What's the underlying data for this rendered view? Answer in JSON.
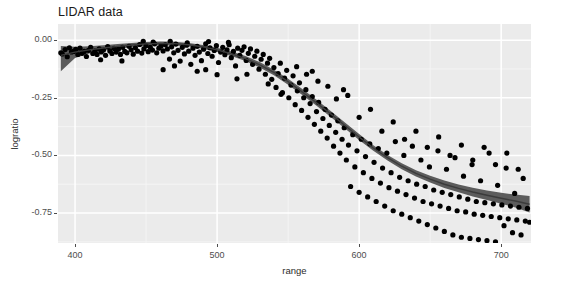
{
  "chart_data": {
    "type": "scatter",
    "title": "LIDAR data",
    "xlabel": "range",
    "ylabel": "logratio",
    "xlim": [
      388,
      721
    ],
    "ylim": [
      -0.88,
      0.07
    ],
    "xticks": [
      400,
      500,
      600,
      700
    ],
    "xtick_labels": [
      "400",
      "500",
      "600",
      "700"
    ],
    "yticks": [
      0.0,
      -0.25,
      -0.5,
      -0.75
    ],
    "ytick_labels": [
      "0.00",
      "-0.25",
      "-0.50",
      "-0.75"
    ],
    "grid": true,
    "grid_major_color": "#ffffff",
    "grid_minor_color": "#f5f5f5",
    "panel_background": "#ebebeb",
    "legend_position": "none",
    "point_color": "#000000",
    "point_radius": 2.6,
    "fit_line_color": "#3b3b3b",
    "fit_band_color": "#4f4f4f",
    "fit_description": "LOESS smooth of logratio on range with shaded confidence band",
    "points": [
      [
        390.0,
        -0.055
      ],
      [
        391.0,
        -0.06
      ],
      [
        393.0,
        -0.041
      ],
      [
        394.5,
        -0.072
      ],
      [
        396.0,
        -0.033
      ],
      [
        397.5,
        -0.051
      ],
      [
        399.0,
        -0.049
      ],
      [
        400.5,
        -0.04
      ],
      [
        402.0,
        -0.062
      ],
      [
        403.5,
        -0.035
      ],
      [
        405.0,
        -0.057
      ],
      [
        406.5,
        -0.049
      ],
      [
        408.0,
        -0.071
      ],
      [
        409.5,
        -0.044
      ],
      [
        411.0,
        -0.031
      ],
      [
        412.5,
        -0.058
      ],
      [
        414.0,
        -0.046
      ],
      [
        415.5,
        -0.062
      ],
      [
        417.0,
        -0.038
      ],
      [
        418.5,
        -0.051
      ],
      [
        420.0,
        -0.043
      ],
      [
        421.5,
        -0.066
      ],
      [
        423.0,
        -0.028
      ],
      [
        424.5,
        -0.047
      ],
      [
        426.0,
        -0.058
      ],
      [
        427.5,
        -0.036
      ],
      [
        429.0,
        -0.052
      ],
      [
        430.5,
        -0.039
      ],
      [
        432.0,
        -0.062
      ],
      [
        433.5,
        -0.031
      ],
      [
        435.0,
        -0.049
      ],
      [
        436.5,
        -0.055
      ],
      [
        438.0,
        -0.027
      ],
      [
        439.5,
        -0.042
      ],
      [
        441.0,
        -0.061
      ],
      [
        442.5,
        -0.033
      ],
      [
        444.0,
        -0.048
      ],
      [
        445.5,
        -0.019
      ],
      [
        447.0,
        -0.056
      ],
      [
        448.5,
        -0.038
      ],
      [
        450.0,
        -0.024
      ],
      [
        451.5,
        -0.05
      ],
      [
        453.0,
        -0.031
      ],
      [
        454.5,
        -0.043
      ],
      [
        456.0,
        -0.016
      ],
      [
        457.5,
        -0.055
      ],
      [
        459.0,
        -0.035
      ],
      [
        460.5,
        -0.026
      ],
      [
        462.0,
        -0.047
      ],
      [
        463.5,
        -0.02
      ],
      [
        465.0,
        -0.038
      ],
      [
        466.5,
        -0.082
      ],
      [
        468.0,
        -0.029
      ],
      [
        469.5,
        -0.055
      ],
      [
        471.0,
        -0.017
      ],
      [
        472.5,
        -0.044
      ],
      [
        474.0,
        -0.091
      ],
      [
        475.5,
        -0.031
      ],
      [
        477.0,
        -0.06
      ],
      [
        478.5,
        -0.022
      ],
      [
        480.0,
        -0.048
      ],
      [
        481.5,
        -0.105
      ],
      [
        483.0,
        -0.035
      ],
      [
        484.5,
        -0.066
      ],
      [
        486.0,
        -0.027
      ],
      [
        487.5,
        -0.052
      ],
      [
        489.0,
        -0.089
      ],
      [
        490.5,
        -0.039
      ],
      [
        492.0,
        -0.016
      ],
      [
        493.5,
        -0.058
      ],
      [
        495.0,
        -0.033
      ],
      [
        496.5,
        -0.07
      ],
      [
        498.0,
        -0.045
      ],
      [
        499.5,
        -0.024
      ],
      [
        501.0,
        -0.097
      ],
      [
        502.5,
        -0.052
      ],
      [
        504.0,
        -0.031
      ],
      [
        505.5,
        -0.063
      ],
      [
        507.0,
        -0.042
      ],
      [
        508.5,
        -0.02
      ],
      [
        510.0,
        -0.076
      ],
      [
        511.5,
        -0.049
      ],
      [
        513.0,
        -0.112
      ],
      [
        514.5,
        -0.035
      ],
      [
        516.0,
        -0.066
      ],
      [
        517.5,
        -0.044
      ],
      [
        519.0,
        -0.029
      ],
      [
        520.5,
        -0.088
      ],
      [
        522.0,
        -0.057
      ],
      [
        523.5,
        -0.038
      ],
      [
        525.0,
        -0.105
      ],
      [
        526.5,
        -0.07
      ],
      [
        528.0,
        -0.048
      ],
      [
        529.5,
        -0.126
      ],
      [
        531.0,
        -0.083
      ],
      [
        532.5,
        -0.062
      ],
      [
        534.0,
        -0.148
      ],
      [
        535.5,
        -0.1
      ],
      [
        537.0,
        -0.079
      ],
      [
        538.5,
        -0.17
      ],
      [
        540.0,
        -0.119
      ],
      [
        541.5,
        -0.205
      ],
      [
        543.0,
        -0.145
      ],
      [
        544.5,
        -0.1
      ],
      [
        546.0,
        -0.228
      ],
      [
        547.5,
        -0.165
      ],
      [
        549.0,
        -0.131
      ],
      [
        550.5,
        -0.25
      ],
      [
        552.0,
        -0.195
      ],
      [
        553.5,
        -0.155
      ],
      [
        555.0,
        -0.28
      ],
      [
        556.5,
        -0.22
      ],
      [
        558.0,
        -0.185
      ],
      [
        559.5,
        -0.305
      ],
      [
        561.0,
        -0.25
      ],
      [
        562.5,
        -0.215
      ],
      [
        564.0,
        -0.335
      ],
      [
        565.5,
        -0.275
      ],
      [
        567.0,
        -0.245
      ],
      [
        568.5,
        -0.365
      ],
      [
        570.0,
        -0.31
      ],
      [
        571.5,
        -0.27
      ],
      [
        573.0,
        -0.395
      ],
      [
        574.5,
        -0.34
      ],
      [
        576.0,
        -0.3
      ],
      [
        577.5,
        -0.425
      ],
      [
        579.0,
        -0.37
      ],
      [
        580.5,
        -0.325
      ],
      [
        582.0,
        -0.46
      ],
      [
        583.5,
        -0.4
      ],
      [
        585.0,
        -0.35
      ],
      [
        586.5,
        -0.49
      ],
      [
        588.0,
        -0.43
      ],
      [
        589.5,
        -0.38
      ],
      [
        591.0,
        -0.52
      ],
      [
        592.5,
        -0.455
      ],
      [
        594.0,
        -0.635
      ],
      [
        595.5,
        -0.41
      ],
      [
        597.0,
        -0.55
      ],
      [
        598.5,
        -0.48
      ],
      [
        600.0,
        -0.66
      ],
      [
        601.5,
        -0.43
      ],
      [
        603.0,
        -0.575
      ],
      [
        604.5,
        -0.505
      ],
      [
        606.0,
        -0.68
      ],
      [
        607.5,
        -0.45
      ],
      [
        609.0,
        -0.6
      ],
      [
        610.5,
        -0.53
      ],
      [
        612.0,
        -0.7
      ],
      [
        613.5,
        -0.47
      ],
      [
        615.0,
        -0.62
      ],
      [
        616.5,
        -0.555
      ],
      [
        618.0,
        -0.72
      ],
      [
        619.5,
        -0.49
      ],
      [
        621.0,
        -0.64
      ],
      [
        622.5,
        -0.575
      ],
      [
        624.0,
        -0.74
      ],
      [
        625.5,
        -0.44
      ],
      [
        627.0,
        -0.655
      ],
      [
        628.5,
        -0.595
      ],
      [
        630.0,
        -0.755
      ],
      [
        631.5,
        -0.5
      ],
      [
        633.0,
        -0.67
      ],
      [
        634.5,
        -0.61
      ],
      [
        636.0,
        -0.77
      ],
      [
        637.5,
        -0.46
      ],
      [
        639.0,
        -0.685
      ],
      [
        640.5,
        -0.625
      ],
      [
        642.0,
        -0.785
      ],
      [
        643.5,
        -0.52
      ],
      [
        645.0,
        -0.7
      ],
      [
        646.5,
        -0.635
      ],
      [
        648.0,
        -0.8
      ],
      [
        649.5,
        -0.55
      ],
      [
        651.0,
        -0.71
      ],
      [
        652.5,
        -0.65
      ],
      [
        654.0,
        -0.815
      ],
      [
        655.5,
        -0.48
      ],
      [
        657.0,
        -0.72
      ],
      [
        658.5,
        -0.66
      ],
      [
        660.0,
        -0.83
      ],
      [
        661.5,
        -0.56
      ],
      [
        663.0,
        -0.73
      ],
      [
        664.5,
        -0.67
      ],
      [
        666.0,
        -0.845
      ],
      [
        667.5,
        -0.51
      ],
      [
        669.0,
        -0.74
      ],
      [
        670.5,
        -0.68
      ],
      [
        672.0,
        -0.855
      ],
      [
        673.5,
        -0.59
      ],
      [
        675.0,
        -0.745
      ],
      [
        676.5,
        -0.69
      ],
      [
        678.0,
        -0.86
      ],
      [
        679.5,
        -0.54
      ],
      [
        681.0,
        -0.755
      ],
      [
        682.5,
        -0.7
      ],
      [
        684.0,
        -0.865
      ],
      [
        685.5,
        -0.61
      ],
      [
        687.0,
        -0.76
      ],
      [
        688.5,
        -0.705
      ],
      [
        690.0,
        -0.87
      ],
      [
        691.5,
        -0.49
      ],
      [
        693.0,
        -0.765
      ],
      [
        694.5,
        -0.71
      ],
      [
        696.0,
        -0.875
      ],
      [
        697.5,
        -0.63
      ],
      [
        699.0,
        -0.77
      ],
      [
        700.5,
        -0.715
      ],
      [
        702.0,
        -0.805
      ],
      [
        703.5,
        -0.555
      ],
      [
        705.0,
        -0.775
      ],
      [
        706.5,
        -0.72
      ],
      [
        708.0,
        -0.835
      ],
      [
        709.5,
        -0.665
      ],
      [
        711.0,
        -0.78
      ],
      [
        712.5,
        -0.725
      ],
      [
        714.0,
        -0.845
      ],
      [
        715.5,
        -0.6
      ],
      [
        717.0,
        -0.785
      ],
      [
        718.5,
        -0.73
      ],
      [
        720.0,
        -0.79
      ],
      [
        462.0,
        -0.128
      ],
      [
        470.0,
        -0.112
      ],
      [
        486.0,
        -0.135
      ],
      [
        492.0,
        -0.128
      ],
      [
        500.0,
        -0.15
      ],
      [
        514.0,
        -0.168
      ],
      [
        521.0,
        -0.148
      ],
      [
        536.0,
        -0.19
      ],
      [
        545.0,
        -0.235
      ],
      [
        563.0,
        -0.148
      ],
      [
        571.0,
        -0.178
      ],
      [
        584.0,
        -0.255
      ],
      [
        592.0,
        -0.24
      ],
      [
        600.0,
        -0.335
      ],
      [
        608.0,
        -0.3
      ],
      [
        616.0,
        -0.395
      ],
      [
        624.0,
        -0.355
      ],
      [
        632.0,
        -0.43
      ],
      [
        640.0,
        -0.395
      ],
      [
        648.0,
        -0.465
      ],
      [
        656.0,
        -0.42
      ],
      [
        664.0,
        -0.5
      ],
      [
        672.0,
        -0.455
      ],
      [
        680.0,
        -0.52
      ],
      [
        688.0,
        -0.465
      ],
      [
        696.0,
        -0.54
      ],
      [
        704.0,
        -0.49
      ],
      [
        712.0,
        -0.56
      ],
      [
        418.0,
        -0.085
      ],
      [
        433.0,
        -0.09
      ],
      [
        448.0,
        -0.005
      ],
      [
        455.0,
        -0.008
      ],
      [
        467.0,
        -0.005
      ],
      [
        479.0,
        -0.012
      ],
      [
        494.0,
        -0.006
      ],
      [
        508.0,
        -0.01
      ],
      [
        556.0,
        -0.115
      ],
      [
        567.0,
        -0.135
      ],
      [
        578.0,
        -0.2
      ],
      [
        589.0,
        -0.215
      ]
    ],
    "fit_line": [
      [
        390,
        -0.066
      ],
      [
        400,
        -0.052
      ],
      [
        410,
        -0.042
      ],
      [
        420,
        -0.034
      ],
      [
        430,
        -0.027
      ],
      [
        440,
        -0.021
      ],
      [
        450,
        -0.016
      ],
      [
        460,
        -0.014
      ],
      [
        470,
        -0.015
      ],
      [
        480,
        -0.02
      ],
      [
        490,
        -0.029
      ],
      [
        500,
        -0.042
      ],
      [
        510,
        -0.059
      ],
      [
        520,
        -0.08
      ],
      [
        530,
        -0.107
      ],
      [
        540,
        -0.14
      ],
      [
        550,
        -0.18
      ],
      [
        560,
        -0.225
      ],
      [
        570,
        -0.272
      ],
      [
        580,
        -0.32
      ],
      [
        590,
        -0.37
      ],
      [
        600,
        -0.42
      ],
      [
        610,
        -0.468
      ],
      [
        620,
        -0.51
      ],
      [
        630,
        -0.547
      ],
      [
        640,
        -0.578
      ],
      [
        650,
        -0.603
      ],
      [
        660,
        -0.625
      ],
      [
        670,
        -0.643
      ],
      [
        680,
        -0.659
      ],
      [
        690,
        -0.673
      ],
      [
        700,
        -0.686
      ],
      [
        710,
        -0.698
      ],
      [
        720,
        -0.712
      ]
    ],
    "fit_band_upper": [
      [
        390,
        -0.025
      ],
      [
        400,
        -0.029
      ],
      [
        410,
        -0.026
      ],
      [
        420,
        -0.022
      ],
      [
        430,
        -0.017
      ],
      [
        440,
        -0.012
      ],
      [
        450,
        -0.008
      ],
      [
        460,
        -0.006
      ],
      [
        470,
        -0.007
      ],
      [
        480,
        -0.012
      ],
      [
        490,
        -0.021
      ],
      [
        500,
        -0.033
      ],
      [
        510,
        -0.049
      ],
      [
        520,
        -0.069
      ],
      [
        530,
        -0.095
      ],
      [
        540,
        -0.128
      ],
      [
        550,
        -0.167
      ],
      [
        560,
        -0.212
      ],
      [
        570,
        -0.259
      ],
      [
        580,
        -0.307
      ],
      [
        590,
        -0.357
      ],
      [
        600,
        -0.407
      ],
      [
        610,
        -0.456
      ],
      [
        620,
        -0.498
      ],
      [
        630,
        -0.534
      ],
      [
        640,
        -0.564
      ],
      [
        650,
        -0.588
      ],
      [
        660,
        -0.609
      ],
      [
        670,
        -0.626
      ],
      [
        680,
        -0.64
      ],
      [
        690,
        -0.652
      ],
      [
        700,
        -0.662
      ],
      [
        710,
        -0.67
      ],
      [
        720,
        -0.676
      ]
    ],
    "fit_band_lower": [
      [
        390,
        -0.135
      ],
      [
        400,
        -0.078
      ],
      [
        410,
        -0.058
      ],
      [
        420,
        -0.046
      ],
      [
        430,
        -0.037
      ],
      [
        440,
        -0.03
      ],
      [
        450,
        -0.025
      ],
      [
        460,
        -0.022
      ],
      [
        470,
        -0.023
      ],
      [
        480,
        -0.028
      ],
      [
        490,
        -0.037
      ],
      [
        500,
        -0.051
      ],
      [
        510,
        -0.069
      ],
      [
        520,
        -0.091
      ],
      [
        530,
        -0.119
      ],
      [
        540,
        -0.152
      ],
      [
        550,
        -0.193
      ],
      [
        560,
        -0.238
      ],
      [
        570,
        -0.285
      ],
      [
        580,
        -0.333
      ],
      [
        590,
        -0.383
      ],
      [
        600,
        -0.433
      ],
      [
        610,
        -0.48
      ],
      [
        620,
        -0.522
      ],
      [
        630,
        -0.56
      ],
      [
        640,
        -0.592
      ],
      [
        650,
        -0.618
      ],
      [
        660,
        -0.641
      ],
      [
        670,
        -0.66
      ],
      [
        680,
        -0.678
      ],
      [
        690,
        -0.694
      ],
      [
        700,
        -0.71
      ],
      [
        710,
        -0.726
      ],
      [
        720,
        -0.748
      ]
    ]
  }
}
